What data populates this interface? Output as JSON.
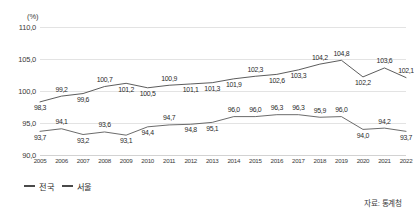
{
  "chart_data": {
    "type": "line",
    "title": "",
    "subtitle": "",
    "unit_label": "(%)",
    "xlabel": "",
    "ylabel": "",
    "ylim": [
      90.0,
      110.0
    ],
    "yticks": [
      "90,0",
      "95,0",
      "100,0",
      "105,0",
      "110,0"
    ],
    "ytick_values": [
      90.0,
      95.0,
      100.0,
      105.0,
      110.0
    ],
    "grid": true,
    "legend_position": "bottom-left",
    "categories": [
      "2005",
      "2006",
      "2007",
      "2008",
      "2009",
      "2010",
      "2011",
      "2012",
      "2013",
      "2014",
      "2015",
      "2016",
      "2017",
      "2018",
      "2019",
      "2020",
      "2021",
      "2022"
    ],
    "series": [
      {
        "name": "전국",
        "color": "#4a4a4a",
        "values": [
          98.3,
          99.2,
          99.6,
          100.7,
          101.2,
          100.5,
          100.9,
          101.1,
          101.3,
          101.9,
          102.3,
          102.6,
          103.3,
          104.2,
          104.8,
          102.2,
          103.6,
          102.1
        ],
        "labels": [
          "98,3",
          "99,2",
          "99,6",
          "100,7",
          "101,2",
          "100,5",
          "100,9",
          "101,1",
          "101,3",
          "101,9",
          "102,3",
          "102,6",
          "103,3",
          "104,2",
          "104,8",
          "102,2",
          "103,6",
          "102,1"
        ],
        "label_pos": [
          "below",
          "above",
          "below",
          "above",
          "below",
          "below",
          "above",
          "below",
          "below",
          "below",
          "above",
          "below",
          "below",
          "above",
          "above",
          "below",
          "above",
          "above"
        ]
      },
      {
        "name": "서울",
        "color": "#5a5a5a",
        "values": [
          93.7,
          94.1,
          93.2,
          93.6,
          93.1,
          94.4,
          94.7,
          94.8,
          95.1,
          96.0,
          96.0,
          96.3,
          96.3,
          95.9,
          96.0,
          94.0,
          94.2,
          93.7
        ],
        "labels": [
          "93,7",
          "94,1",
          "93,2",
          "93,6",
          "93,1",
          "94,4",
          "94,7",
          "94,8",
          "95,1",
          "96,0",
          "96,0",
          "96,3",
          "96,3",
          "95,9",
          "96,0",
          "94,0",
          "94,2",
          "93,7"
        ],
        "label_pos": [
          "below",
          "above",
          "below",
          "above",
          "below",
          "below",
          "above",
          "below",
          "below",
          "above",
          "above",
          "above",
          "above",
          "above",
          "above",
          "below",
          "above",
          "below"
        ]
      }
    ],
    "source": "자료: 통계청"
  },
  "legend": {
    "items": [
      {
        "label": "전국"
      },
      {
        "label": "서울"
      }
    ]
  },
  "footer": {
    "source": "자료: 통계청"
  }
}
